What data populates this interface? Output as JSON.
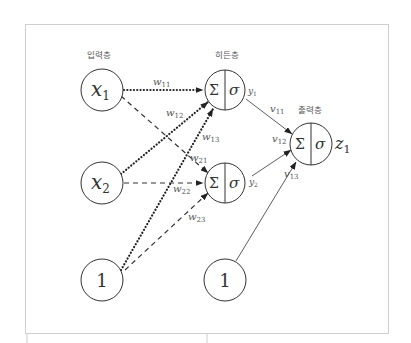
{
  "layers": {
    "input": "입력층",
    "hidden": "히든층",
    "output": "출력층"
  },
  "nodes": {
    "x1": {
      "base": "x",
      "sub": "1"
    },
    "x2": {
      "base": "x",
      "sub": "2"
    },
    "bias_input": {
      "label": "1"
    },
    "h1": {
      "sum": "Σ",
      "activation": "σ",
      "out_base": "y",
      "out_sub": "1"
    },
    "h2": {
      "sum": "Σ",
      "activation": "σ",
      "out_base": "y",
      "out_sub": "2"
    },
    "bias_hidden": {
      "label": "1"
    },
    "output": {
      "sum": "Σ",
      "activation": "σ",
      "out_base": "z",
      "out_sub": "1"
    }
  },
  "weights": {
    "w11": {
      "base": "w",
      "sub": "11"
    },
    "w12": {
      "base": "w",
      "sub": "12"
    },
    "w13": {
      "base": "w",
      "sub": "13"
    },
    "w21": {
      "base": "w",
      "sub": "21"
    },
    "w22": {
      "base": "w",
      "sub": "22"
    },
    "w23": {
      "base": "w",
      "sub": "23"
    },
    "v11": {
      "base": "v",
      "sub": "11"
    },
    "v12": {
      "base": "v",
      "sub": "12"
    },
    "v13": {
      "base": "v",
      "sub": "13"
    }
  },
  "edges": [
    {
      "from": "x1",
      "to": "h1",
      "weight": "w11",
      "style": "dotted"
    },
    {
      "from": "x2",
      "to": "h1",
      "weight": "w12",
      "style": "dotted"
    },
    {
      "from": "bias_input",
      "to": "h1",
      "weight": "w13",
      "style": "dotted"
    },
    {
      "from": "x1",
      "to": "h2",
      "weight": "w21",
      "style": "dashed"
    },
    {
      "from": "x2",
      "to": "h2",
      "weight": "w22",
      "style": "dashed"
    },
    {
      "from": "bias_input",
      "to": "h2",
      "weight": "w23",
      "style": "dashed"
    },
    {
      "from": "h1",
      "to": "output",
      "weight": "v11",
      "style": "solid"
    },
    {
      "from": "h2",
      "to": "output",
      "weight": "v12",
      "style": "solid"
    },
    {
      "from": "bias_hidden",
      "to": "output",
      "weight": "v13",
      "style": "solid"
    }
  ],
  "colors": {
    "line": "#333333",
    "frame": "#cfcfcf",
    "label": "#555555"
  }
}
